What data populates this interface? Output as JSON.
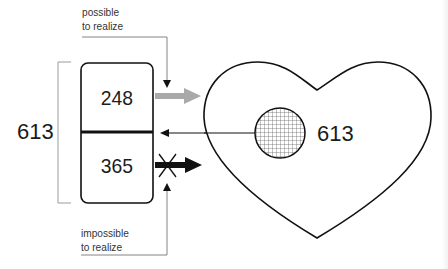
{
  "diagram": {
    "top_note": {
      "line1": "possible",
      "line2": "to realize"
    },
    "bottom_note": {
      "line1": "impossible",
      "line2": "to realize"
    },
    "total_left": "613",
    "box": {
      "upper_value": "248",
      "lower_value": "365"
    },
    "heart": {
      "inner_circle_value": "613",
      "circle_fill": "crosshatch"
    },
    "arrows": {
      "upper_out": {
        "direction": "right",
        "color": "#a9a9a9",
        "meaning": "possible to realize"
      },
      "middle_in": {
        "direction": "left",
        "color": "#111111"
      },
      "lower_out": {
        "direction": "right",
        "color": "#111111",
        "blocked": true,
        "meaning": "impossible to realize"
      }
    },
    "colors": {
      "stroke": "#111111",
      "bracket": "#9a9a9a",
      "pointer": "#777777",
      "gray_arrow": "#a9a9a9"
    }
  }
}
